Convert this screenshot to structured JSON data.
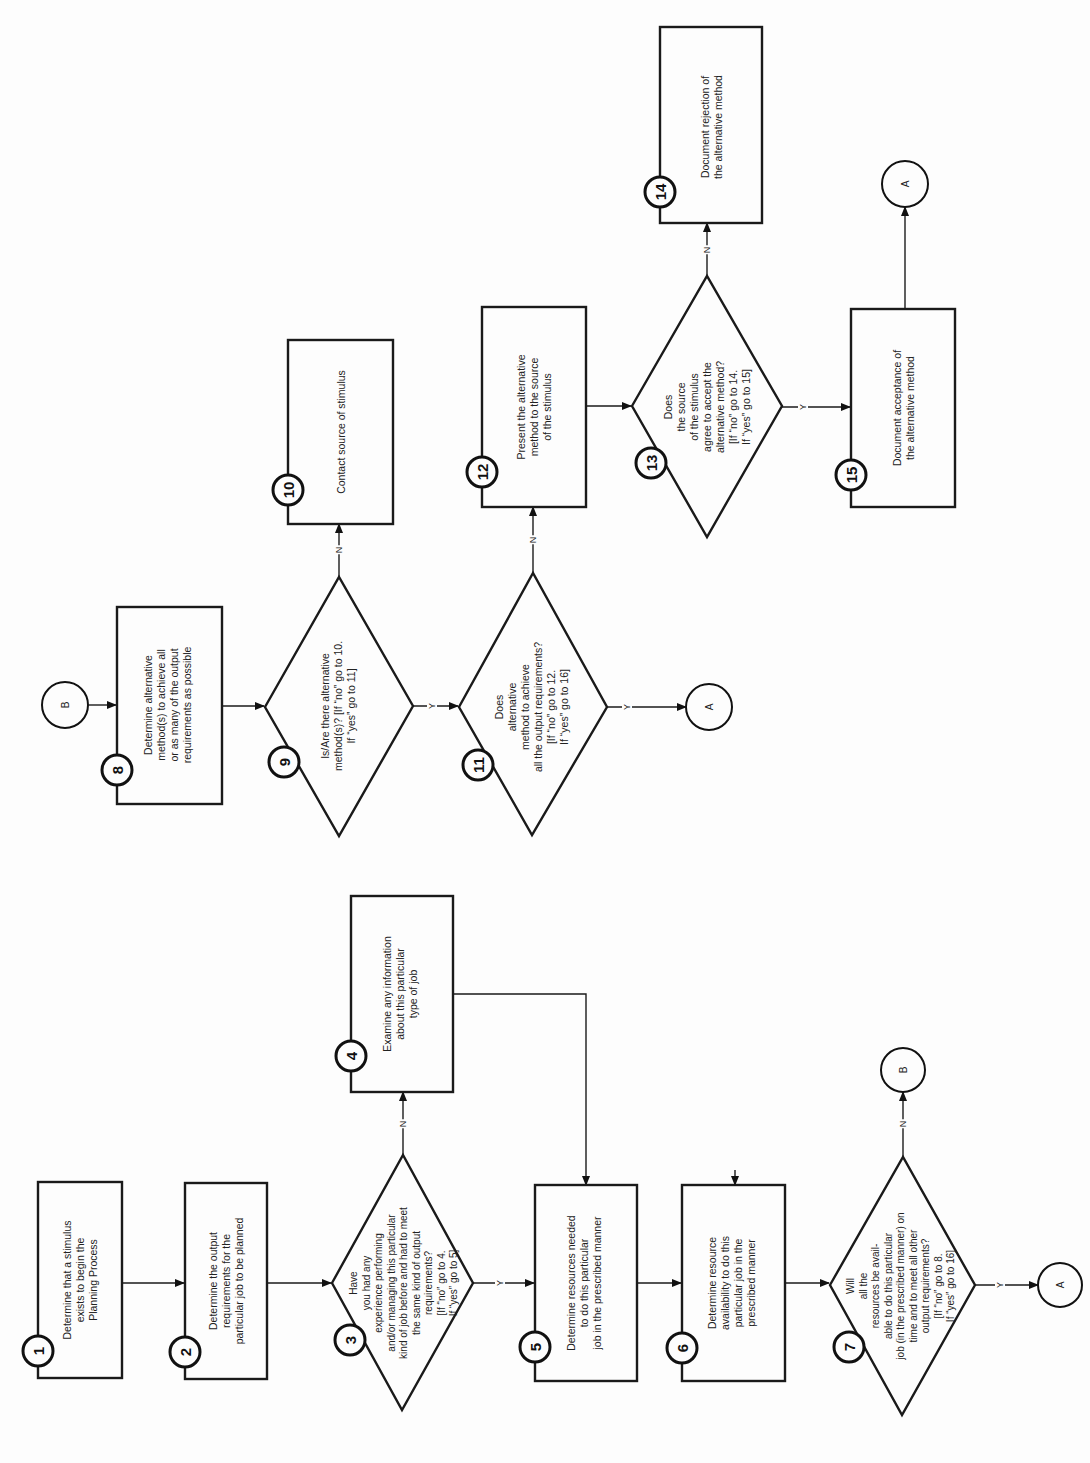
{
  "colors": {
    "ink": "#1a1a1a",
    "paper": "#fdfdfd"
  },
  "orientation": "rotated -90deg (reads bottom-to-top)",
  "steps": {
    "s1": {
      "num": "1",
      "type": "process",
      "text": "Determine that a stimulus\nexists to begin the\nPlanning Process"
    },
    "s2": {
      "num": "2",
      "type": "process",
      "text": "Determine the output\nrequirements for the\nparticular job to be planned"
    },
    "s3": {
      "num": "3",
      "type": "decision",
      "text": "Have\nyou had any\nexperience performing\nand/or managing this particular\nkind of job before and had to meet\nthe same kind of output\nrequirements?\n[If “no” go to 4.\nIf “yes” go to 5]"
    },
    "s4": {
      "num": "4",
      "type": "process",
      "text": "Examine any information\nabout this particular\ntype of job"
    },
    "s5": {
      "num": "5",
      "type": "process",
      "text": "Determine resources needed\nto do this particular\njob in the prescribed manner"
    },
    "s6": {
      "num": "6",
      "type": "process",
      "text": "Determine resource\navailability to do this\nparticular job in the\nprescribed manner"
    },
    "s7": {
      "num": "7",
      "type": "decision",
      "text": "Will\nall the\nresources be avail-\nable to do this particular\njob (in the prescribed manner) on\ntime and to meet all other\noutput requirements?\n[If “no” go to 8.\nIf “yes” go to 16]"
    },
    "s8": {
      "num": "8",
      "type": "process",
      "text": "Determine alternative\nmethod(s) to achieve all\nor as many of the output\nrequirements as possible"
    },
    "s9": {
      "num": "9",
      "type": "decision",
      "text": "Is/Are there alternative\nmethod(s)? [If “no” go to 10.\nIf “yes” go to 11]"
    },
    "s10": {
      "num": "10",
      "type": "process",
      "text": "Contact source of stimulus"
    },
    "s11": {
      "num": "11",
      "type": "decision",
      "text": "Does\nalternative\nmethod to achieve\nall the output requirements?\n[If “no” go to 12.\nIf “yes” go to 16]"
    },
    "s12": {
      "num": "12",
      "type": "process",
      "text": "Present the alternative\nmethod to the source\nof the stimulus"
    },
    "s13": {
      "num": "13",
      "type": "decision",
      "text": "Does\nthe source\nof the stimulus\nagree to accept the\nalternative method?\n[If “no” go to 14.\nIf “yes” go to 15]"
    },
    "s14": {
      "num": "14",
      "type": "process",
      "text": "Document rejection of\nthe alternative method"
    },
    "s15": {
      "num": "15",
      "type": "process",
      "text": "Document acceptance of\nthe alternative method"
    }
  },
  "connectors": {
    "a": "A",
    "b": "B"
  },
  "branch_labels": {
    "yes": "Y",
    "no": "N"
  }
}
